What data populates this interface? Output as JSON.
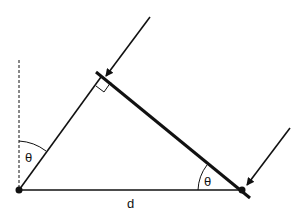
{
  "diagram": {
    "labels": {
      "theta_left": "θ",
      "theta_right": "θ",
      "distance": "d"
    },
    "colors": {
      "stroke": "#111111",
      "background": "#ffffff"
    }
  }
}
